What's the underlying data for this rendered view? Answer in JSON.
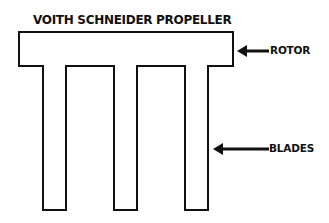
{
  "diagram": {
    "title": "VOITH SCHNEIDER PROPELLER",
    "components": {
      "rotor": {
        "label": "ROTOR"
      },
      "blades": {
        "label": "BLADES",
        "count": 3
      }
    },
    "colors": {
      "stroke": "#111111",
      "background": "#ffffff"
    }
  }
}
